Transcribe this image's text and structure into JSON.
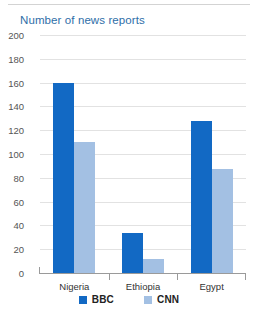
{
  "chart_data": {
    "type": "bar",
    "title": "Number of news reports",
    "xlabel": "",
    "ylabel": "",
    "categories": [
      "Nigeria",
      "Ethiopia",
      "Egypt"
    ],
    "series": [
      {
        "name": "BBC",
        "color": "#1269c4",
        "values": [
          160,
          34,
          128
        ]
      },
      {
        "name": "CNN",
        "color": "#a3c0e3",
        "values": [
          110,
          12,
          87
        ]
      }
    ],
    "ylim": [
      0,
      200
    ],
    "ytick_step": 20,
    "ytick_labels": [
      "200",
      "180",
      "160",
      "140",
      "120",
      "100",
      "80",
      "60",
      "40",
      "20",
      "0"
    ],
    "grid": true,
    "legend_position": "bottom-center",
    "title_color": "#2e6ea8",
    "gridline_color": "#e2e2e2",
    "axis_color": "#9a9a9a",
    "background_color": "#ffffff"
  }
}
